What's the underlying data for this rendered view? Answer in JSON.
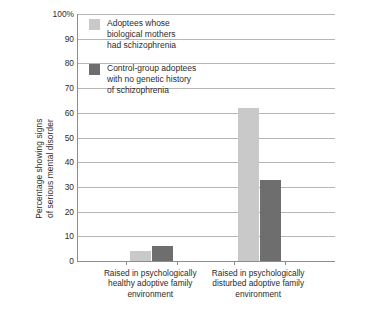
{
  "chart_data": {
    "type": "bar",
    "title": "",
    "xlabel": "",
    "ylabel_lines": [
      "Percentage showing signs",
      "of serious mental disorder"
    ],
    "ylim": [
      0,
      100
    ],
    "ytick_labels": [
      "0",
      "10",
      "20",
      "30",
      "40",
      "50",
      "60",
      "70",
      "80",
      "90",
      "100%"
    ],
    "ytick_values": [
      0,
      10,
      20,
      30,
      40,
      50,
      60,
      70,
      80,
      90,
      100
    ],
    "grid": true,
    "legend_position": "top-left-inside",
    "categories": [
      "Raised in psychologically healthy adoptive family environment",
      "Raised in psychologically disturbed adoptive family environment"
    ],
    "category_label_lines": [
      [
        "Raised in psychologically",
        "healthy adoptive family",
        "environment"
      ],
      [
        "Raised in psychologically",
        "disturbed adoptive family",
        "environment"
      ]
    ],
    "series": [
      {
        "name": "Adoptees whose biological mothers had schizophrenia",
        "name_lines": [
          "Adoptees whose",
          "biological mothers",
          "had schizophrenia"
        ],
        "color": "#c9c9c9",
        "values": [
          4,
          62
        ]
      },
      {
        "name": "Control-group adoptees with no genetic history of schizophrenia",
        "name_lines": [
          "Control-group adoptees",
          "with no genetic history",
          "of schizophrenia"
        ],
        "color": "#6e6e6e",
        "values": [
          6,
          33
        ]
      }
    ]
  },
  "colors": {
    "axis": "#8d8d8d",
    "grid": "#b6b6b6",
    "text": "#2b2b2b",
    "background": "#ffffff",
    "series_light": "#c9c9c9",
    "series_dark": "#6e6e6e"
  }
}
